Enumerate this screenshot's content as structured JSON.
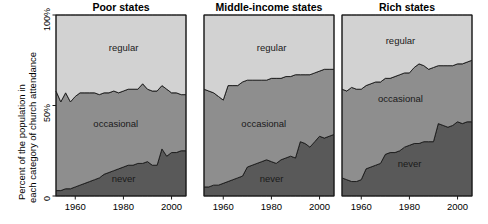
{
  "chart_data": {
    "type": "area",
    "title": "",
    "ylabel": "Percent of the population in each category of church attendance",
    "ylabel_line1": "Percent of the population in",
    "ylabel_line2": "each category of church attendance",
    "xlabel": "",
    "ylim": [
      0,
      100
    ],
    "xlim": [
      1952,
      2006
    ],
    "grid": false,
    "legend_position": "inline-band-labels",
    "stacked": true,
    "stack_order_bottom_to_top": [
      "never",
      "occasional",
      "regular"
    ],
    "y_ticks": [
      {
        "value": 0,
        "label": "0"
      },
      {
        "value": 50,
        "label": "50%"
      },
      {
        "value": 100,
        "label": "100%"
      }
    ],
    "x_ticks": [
      {
        "value": 1960,
        "label": "1960"
      },
      {
        "value": 1980,
        "label": "1980"
      },
      {
        "value": 2000,
        "label": "2000"
      }
    ],
    "series_colors": {
      "never": "#595959",
      "occasional": "#8e8e8e",
      "regular": "#d2d2d2"
    },
    "band_labels": {
      "regular": "regular",
      "occasional": "occasional",
      "never": "never"
    },
    "panels": [
      {
        "title": "Poor states",
        "x": [
          1952,
          1954,
          1956,
          1958,
          1960,
          1962,
          1964,
          1966,
          1968,
          1970,
          1972,
          1974,
          1976,
          1978,
          1980,
          1982,
          1984,
          1986,
          1988,
          1990,
          1992,
          1994,
          1996,
          1998,
          2000,
          2002,
          2004,
          2006
        ],
        "series": [
          {
            "name": "never",
            "values": [
              3,
              3,
              4,
              4,
              5,
              6,
              7,
              8,
              9,
              10,
              12,
              13,
              14,
              15,
              16,
              17,
              17,
              18,
              18,
              19,
              17,
              17,
              26,
              22,
              24,
              24,
              25,
              25
            ]
          },
          {
            "name": "occasional",
            "values": [
              55,
              49,
              53,
              48,
              50,
              51,
              50,
              49,
              48,
              46,
              45,
              44,
              44,
              42,
              42,
              42,
              42,
              41,
              44,
              40,
              41,
              41,
              35,
              37,
              33,
              33,
              31,
              31
            ]
          },
          {
            "name": "regular",
            "values": [
              42,
              48,
              43,
              48,
              45,
              43,
              43,
              43,
              43,
              44,
              43,
              43,
              42,
              43,
              42,
              41,
              41,
              41,
              38,
              41,
              42,
              42,
              39,
              41,
              43,
              43,
              44,
              44
            ]
          }
        ]
      },
      {
        "title": "Middle-income states",
        "x": [
          1952,
          1954,
          1956,
          1958,
          1960,
          1962,
          1964,
          1966,
          1968,
          1970,
          1972,
          1974,
          1976,
          1978,
          1980,
          1982,
          1984,
          1986,
          1988,
          1990,
          1992,
          1994,
          1996,
          1998,
          2000,
          2002,
          2004,
          2006
        ],
        "series": [
          {
            "name": "never",
            "values": [
              5,
              5,
              6,
              6,
              7,
              8,
              9,
              10,
              11,
              16,
              17,
              18,
              19,
              20,
              19,
              18,
              20,
              21,
              22,
              21,
              30,
              29,
              27,
              30,
              33,
              32,
              33,
              34
            ]
          },
          {
            "name": "occasional",
            "values": [
              54,
              53,
              51,
              49,
              46,
              53,
              52,
              51,
              52,
              48,
              47,
              46,
              45,
              44,
              46,
              47,
              45,
              45,
              44,
              46,
              37,
              38,
              40,
              38,
              36,
              38,
              37,
              36
            ]
          },
          {
            "name": "regular",
            "values": [
              41,
              42,
              43,
              45,
              47,
              39,
              39,
              39,
              37,
              36,
              36,
              36,
              36,
              36,
              35,
              35,
              35,
              34,
              34,
              33,
              33,
              33,
              33,
              32,
              31,
              30,
              30,
              30
            ]
          }
        ]
      },
      {
        "title": "Rich states",
        "x": [
          1952,
          1954,
          1956,
          1958,
          1960,
          1962,
          1964,
          1966,
          1968,
          1970,
          1972,
          1974,
          1976,
          1978,
          1980,
          1982,
          1984,
          1986,
          1988,
          1990,
          1992,
          1994,
          1996,
          1998,
          2000,
          2002,
          2004,
          2006
        ],
        "series": [
          {
            "name": "never",
            "values": [
              10,
              9,
              8,
              8,
              9,
              15,
              16,
              17,
              18,
              23,
              24,
              24,
              25,
              27,
              28,
              29,
              29,
              30,
              30,
              30,
              40,
              39,
              38,
              39,
              41,
              40,
              41,
              41
            ]
          },
          {
            "name": "occasional",
            "values": [
              49,
              49,
              52,
              51,
              50,
              46,
              46,
              46,
              45,
              42,
              41,
              42,
              42,
              41,
              40,
              42,
              44,
              42,
              40,
              41,
              32,
              33,
              34,
              33,
              32,
              33,
              33,
              34
            ]
          },
          {
            "name": "regular",
            "values": [
              41,
              42,
              40,
              41,
              41,
              39,
              38,
              37,
              37,
              35,
              35,
              34,
              33,
              32,
              32,
              29,
              27,
              28,
              30,
              29,
              28,
              28,
              28,
              28,
              27,
              27,
              26,
              25
            ]
          }
        ]
      }
    ]
  }
}
